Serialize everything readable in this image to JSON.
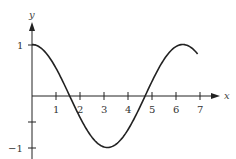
{
  "chart_data": {
    "type": "line",
    "title": "",
    "xlabel": "x",
    "ylabel": "y",
    "xlim": [
      0,
      7.4
    ],
    "ylim": [
      -1.1,
      1.1
    ],
    "grid": false,
    "legend": null,
    "x_ticks": [
      1,
      2,
      3,
      4,
      5,
      6,
      7
    ],
    "x_tick_labels": [
      "1",
      "2",
      "3",
      "4",
      "5",
      "6",
      "7"
    ],
    "y_ticks": [
      1,
      0.5,
      -0.5,
      -1
    ],
    "y_tick_labels": [
      "1",
      "",
      "",
      "−1"
    ],
    "series": [
      {
        "name": "y = cos x",
        "color": "#222222",
        "x": [
          0,
          0.5,
          1,
          1.5,
          1.571,
          2,
          2.5,
          3,
          3.1416,
          3.5,
          4,
          4.5,
          4.712,
          5,
          5.5,
          6,
          6.2832,
          6.5,
          6.9
        ],
        "y": [
          1,
          0.878,
          0.54,
          0.071,
          0,
          -0.416,
          -0.801,
          -0.99,
          -1,
          -0.936,
          -0.654,
          -0.211,
          0,
          0.284,
          0.709,
          0.96,
          1,
          0.977,
          0.815
        ]
      }
    ]
  },
  "labels": {
    "x_axis": "x",
    "y_axis": "y",
    "y_top": "1",
    "y_bottom": "−1",
    "x1": "1",
    "x2": "2",
    "x3": "3",
    "x4": "4",
    "x5": "5",
    "x6": "6",
    "x7": "7"
  }
}
